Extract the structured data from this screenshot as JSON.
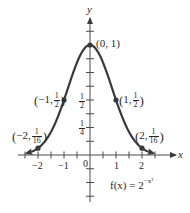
{
  "chart_data": {
    "type": "line",
    "title": "",
    "function_label": {
      "prefix": "f(x) = 2",
      "exponent": "−x²"
    },
    "xlabel": "x",
    "ylabel": "y",
    "xlim": [
      -2.4,
      2.4
    ],
    "ylim": [
      0,
      1
    ],
    "x_tick_labels": [
      "−2",
      "−1",
      "0",
      "1",
      "2"
    ],
    "x_ticks": [
      -2.5,
      -2,
      -1.5,
      -1,
      -0.5,
      0.5,
      1,
      1.5,
      2,
      2.5
    ],
    "y_tick_labels": [
      {
        "value": 0.5,
        "num": "1",
        "den": "2"
      },
      {
        "value": 0.25,
        "num": "1",
        "den": "4"
      }
    ],
    "y_ticks": [
      -0.375,
      -0.25,
      -0.125,
      0.125,
      0.25,
      0.375,
      0.5,
      0.625,
      0.75,
      0.875,
      1.125
    ],
    "grid": false,
    "series": [
      {
        "name": "f(x) = 2^(-x^2)",
        "x": [
          -2.4,
          -2,
          -1.5,
          -1,
          -0.5,
          0,
          0.5,
          1,
          1.5,
          2,
          2.4
        ],
        "values": [
          0.0184,
          0.0625,
          0.2102,
          0.5,
          0.8409,
          1,
          0.8409,
          0.5,
          0.2102,
          0.0625,
          0.0184
        ]
      }
    ],
    "labeled_points": [
      {
        "x": -2,
        "y": "1/16",
        "label": "(−2, 1/16)",
        "num": "1",
        "den": "16",
        "xtext": "−2"
      },
      {
        "x": -1,
        "y": "1/2",
        "label": "(−1, 1/2)",
        "num": "1",
        "den": "2",
        "xtext": "−1"
      },
      {
        "x": 0,
        "y": "1",
        "label": "(0, 1)"
      },
      {
        "x": 1,
        "y": "1/2",
        "label": "(1, 1/2)",
        "num": "1",
        "den": "2",
        "xtext": "1"
      },
      {
        "x": 2,
        "y": "1/16",
        "label": "(2, 1/16)",
        "num": "1",
        "den": "16",
        "xtext": "2"
      }
    ],
    "colors": {
      "curve": "#3a3a3a",
      "axis": "#4a4a4a",
      "text": "#2a2a2a"
    }
  }
}
